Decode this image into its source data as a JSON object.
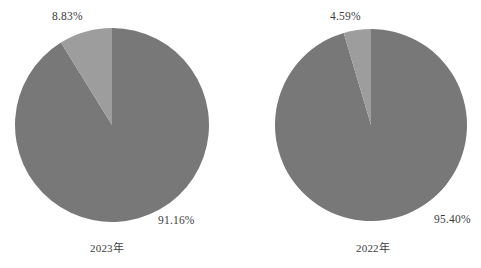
{
  "chart_data": [
    {
      "type": "pie",
      "title": "2023年",
      "categories": [
        "91.16%",
        "8.83%"
      ],
      "values": [
        91.16,
        8.83
      ],
      "labels": [
        "91.16%",
        "8.83%"
      ],
      "colors": [
        "#787878",
        "#9d9d9d"
      ],
      "start_angle": 90,
      "direction": "counterclockwise",
      "legend": "none",
      "grid": false
    },
    {
      "type": "pie",
      "title": "2022年",
      "categories": [
        "95.40%",
        "4.59%"
      ],
      "values": [
        95.4,
        4.59
      ],
      "labels": [
        "95.40%",
        "4.59%"
      ],
      "colors": [
        "#787878",
        "#9d9d9d"
      ],
      "start_angle": 90,
      "direction": "counterclockwise",
      "legend": "none",
      "grid": false
    }
  ],
  "figure": {
    "background": "#ffffff",
    "slice_color_major": "#787878",
    "slice_color_minor": "#9d9d9d"
  },
  "panels": {
    "left": {
      "year_label": "2023年",
      "major_label": "91.16%",
      "minor_label": "8.83%"
    },
    "right": {
      "year_label": "2022年",
      "major_label": "95.40%",
      "minor_label": "4.59%"
    }
  }
}
